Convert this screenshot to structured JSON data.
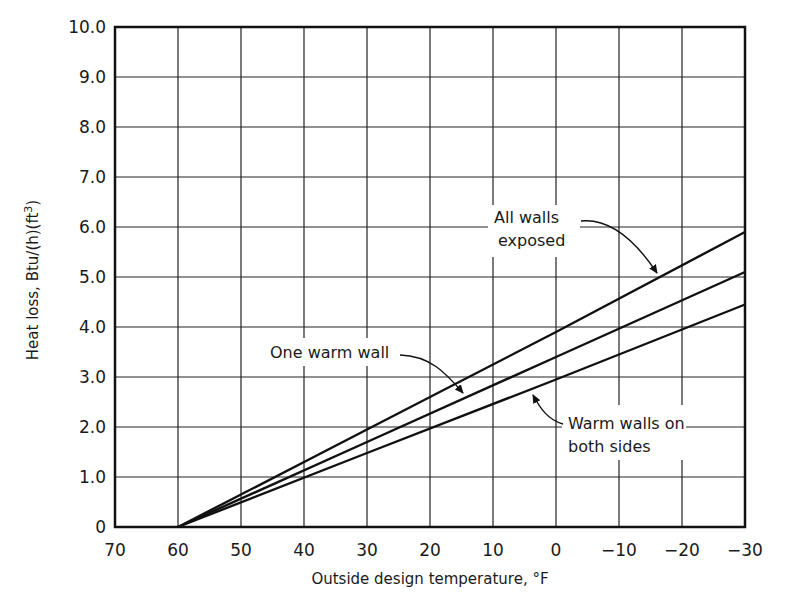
{
  "chart_data": {
    "type": "line",
    "title": "",
    "xlabel": "Outside design temperature, °F",
    "ylabel": "Heat loss, Btu/(h)(ft³)",
    "ylabel_parts": {
      "main": "Heat loss, Btu/(h)(ft",
      "sup": "3",
      "end": ")"
    },
    "xlim": [
      70,
      -30
    ],
    "ylim": [
      0,
      10
    ],
    "x_ticks": [
      70,
      60,
      50,
      40,
      30,
      20,
      10,
      0,
      -10,
      -20,
      -30
    ],
    "x_tick_labels": [
      "70",
      "60",
      "50",
      "40",
      "30",
      "20",
      "10",
      "0",
      "−10",
      "−20",
      "−30"
    ],
    "y_ticks": [
      0,
      1,
      2,
      3,
      4,
      5,
      6,
      7,
      8,
      9,
      10
    ],
    "y_tick_labels": [
      "0",
      "1.0",
      "2.0",
      "3.0",
      "4.0",
      "5.0",
      "6.0",
      "7.0",
      "8.0",
      "9.0",
      "10.0"
    ],
    "grid": true,
    "legend": "inline annotations with arrows",
    "series": [
      {
        "name": "All walls exposed",
        "x": [
          60,
          30,
          0,
          -30
        ],
        "values": [
          0,
          1.95,
          3.9,
          5.9
        ]
      },
      {
        "name": "One warm wall",
        "x": [
          60,
          30,
          0,
          -30
        ],
        "values": [
          0,
          1.7,
          3.4,
          5.1
        ]
      },
      {
        "name": "Warm walls on both sides",
        "x": [
          60,
          30,
          0,
          -30
        ],
        "values": [
          0,
          1.48,
          2.95,
          4.45
        ]
      }
    ],
    "annotations": [
      {
        "lines": [
          "All walls",
          "exposed"
        ],
        "target_series": "All walls exposed"
      },
      {
        "lines": [
          "One warm wall"
        ],
        "target_series": "One warm wall"
      },
      {
        "lines": [
          "Warm walls on",
          "both sides"
        ],
        "target_series": "Warm walls on both sides"
      }
    ]
  }
}
